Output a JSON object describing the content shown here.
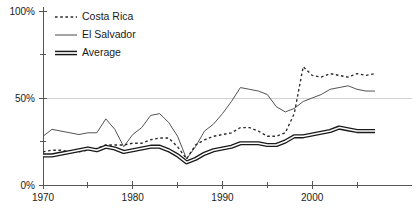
{
  "chart_data": {
    "type": "line",
    "title": "",
    "subtitle": "",
    "xlabel": "",
    "ylabel": "",
    "xlim": [
      1970,
      2007
    ],
    "ylim": [
      0,
      100
    ],
    "grid": "horizontal gridline at 50% only",
    "legend_position": "top-left inside plot area",
    "y_tick_labels": [
      "100%",
      "50%",
      "0%"
    ],
    "y_tick_values": [
      100,
      50,
      0
    ],
    "y_minor_ticks": [
      75,
      25
    ],
    "x_tick_labels": [
      "1970",
      "1980",
      "1990",
      "2000"
    ],
    "x_tick_values": [
      1970,
      1980,
      1990,
      2000
    ],
    "x_minor_ticks": [
      1975,
      1985,
      1995,
      2005
    ],
    "x": [
      1970,
      1971,
      1972,
      1973,
      1974,
      1975,
      1976,
      1977,
      1978,
      1979,
      1980,
      1981,
      1982,
      1983,
      1984,
      1985,
      1986,
      1987,
      1988,
      1989,
      1990,
      1991,
      1992,
      1993,
      1994,
      1995,
      1996,
      1997,
      1998,
      1999,
      2000,
      2001,
      2002,
      2003,
      2004,
      2005,
      2006,
      2007
    ],
    "series": [
      {
        "name": "Costa Rica",
        "style": "dashed",
        "values": [
          19,
          20,
          20,
          19,
          19,
          20,
          21,
          23,
          23,
          23,
          24,
          24,
          26,
          27,
          27,
          22,
          15,
          23,
          26,
          28,
          29,
          30,
          33,
          33,
          31,
          28,
          28,
          30,
          41,
          68,
          63,
          62,
          64,
          63,
          62,
          64,
          63,
          64
        ]
      },
      {
        "name": "El Salvador",
        "style": "solid-thin",
        "values": [
          28,
          32,
          31,
          30,
          29,
          30,
          30,
          38,
          32,
          22,
          29,
          33,
          40,
          41,
          36,
          28,
          15,
          22,
          31,
          35,
          41,
          48,
          56,
          55,
          54,
          52,
          45,
          42,
          44,
          48,
          50,
          52,
          55,
          56,
          57,
          55,
          54,
          54
        ]
      },
      {
        "name": "Average",
        "style": "thick-band",
        "values": [
          17,
          17,
          18,
          19,
          20,
          21,
          20,
          22,
          21,
          19,
          20,
          21,
          22,
          22,
          20,
          17,
          13,
          15,
          18,
          20,
          21,
          22,
          24,
          24,
          24,
          23,
          23,
          25,
          28,
          28,
          29,
          30,
          31,
          33,
          32,
          31,
          31,
          31
        ]
      }
    ]
  },
  "legend": {
    "items": [
      {
        "label": "Costa Rica",
        "style": "dashed"
      },
      {
        "label": "El Salvador",
        "style": "solid-thin"
      },
      {
        "label": "Average",
        "style": "thick-band"
      }
    ]
  },
  "axes": {
    "y_labels": [
      {
        "text": "100%",
        "value": 100
      },
      {
        "text": "50%",
        "value": 50
      },
      {
        "text": "0%",
        "value": 0
      }
    ],
    "x_labels": [
      {
        "text": "1970",
        "value": 1970
      },
      {
        "text": "1980",
        "value": 1980
      },
      {
        "text": "1990",
        "value": 1990
      },
      {
        "text": "2000",
        "value": 2000
      }
    ]
  },
  "colors": {
    "costa_rica": "#2a2a2a",
    "el_salvador": "#4a4a4a",
    "average": "#1a1a1a",
    "axis": "#555555",
    "grid": "#c8c8c8",
    "background": "#ffffff"
  }
}
